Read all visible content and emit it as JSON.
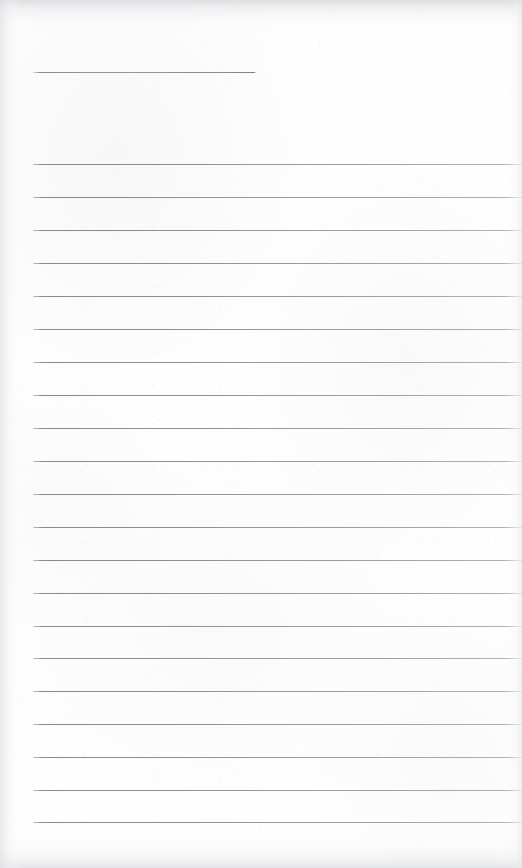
{
  "document": {
    "kind": "blank-ruled-page",
    "page_width": 522,
    "page_height": 868,
    "background_color": "#fefefe",
    "rule_color": "#8a8b91",
    "text_content": "",
    "header_note": "",
    "body_note": ""
  },
  "header_rule": {
    "name": "header-rule",
    "x": 33,
    "y": 72,
    "width": 223,
    "thickness": 1
  },
  "ruling": {
    "count": 21,
    "first_y": 164,
    "spacing": 32.9,
    "left_x": 33,
    "right_x": 522,
    "thickness": 1,
    "lines": [
      {
        "index": 1,
        "y": 164
      },
      {
        "index": 2,
        "y": 197
      },
      {
        "index": 3,
        "y": 230
      },
      {
        "index": 4,
        "y": 263
      },
      {
        "index": 5,
        "y": 296
      },
      {
        "index": 6,
        "y": 329
      },
      {
        "index": 7,
        "y": 362
      },
      {
        "index": 8,
        "y": 395
      },
      {
        "index": 9,
        "y": 428
      },
      {
        "index": 10,
        "y": 461
      },
      {
        "index": 11,
        "y": 494
      },
      {
        "index": 12,
        "y": 527
      },
      {
        "index": 13,
        "y": 560
      },
      {
        "index": 14,
        "y": 593
      },
      {
        "index": 15,
        "y": 626
      },
      {
        "index": 16,
        "y": 658
      },
      {
        "index": 17,
        "y": 691
      },
      {
        "index": 18,
        "y": 724
      },
      {
        "index": 19,
        "y": 757
      },
      {
        "index": 20,
        "y": 790
      },
      {
        "index": 21,
        "y": 822
      }
    ]
  },
  "scan_artifacts": {
    "top_edge_shadow": "#d6d7da",
    "bottom_edge_shadow": "#dbdcdf",
    "left_edge_shadow": "#e0e1e4",
    "right_edge_shadow": "#e4e5e8"
  }
}
